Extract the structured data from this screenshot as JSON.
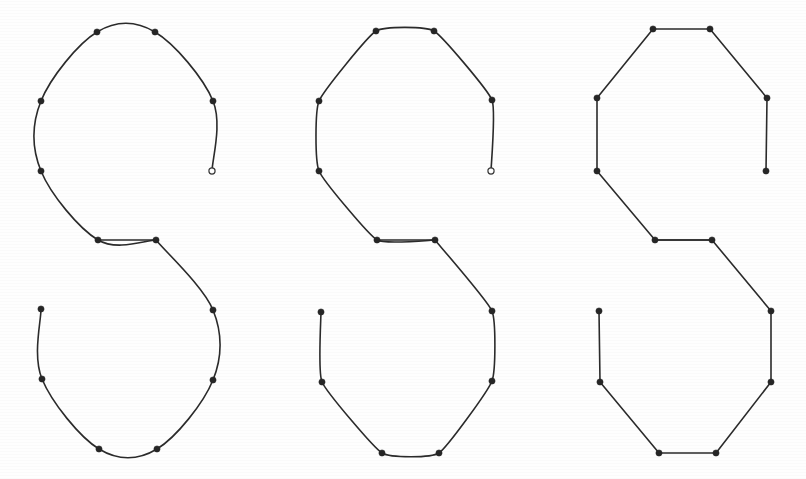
{
  "figure": {
    "caption": "",
    "background_color": "#fefefe",
    "stroke_color": "#2b2b2b",
    "dot_color": "#262626",
    "stroke_width": 1.6,
    "dot_radius": 3.1,
    "width": 806,
    "height": 479
  },
  "chart_data": {
    "type": "line",
    "subtitle": "",
    "xlabel": "",
    "ylabel": "",
    "grid": false,
    "legend": "none",
    "xlim": [
      0,
      806
    ],
    "ylim": [
      479,
      0
    ],
    "note": "Three panels, left to right: smooth limit curve, one subdivision refinement, original control polygon. All three panels share the same 16 marked sample points at identical relative positions.",
    "panels": [
      {
        "name": "limit-curve",
        "label": "smooth limit curve",
        "index": 0,
        "origin_x": 41,
        "rendering": "smooth",
        "closed": true,
        "points": [
          {
            "x": 97,
            "y": 32
          },
          {
            "x": 155,
            "y": 32
          },
          {
            "x": 213,
            "y": 101
          },
          {
            "x": 212,
            "y": 171
          },
          {
            "x": 156,
            "y": 240
          },
          {
            "x": 98,
            "y": 240
          },
          {
            "x": 41,
            "y": 171
          },
          {
            "x": 41,
            "y": 101
          }
        ],
        "points_lower": [
          {
            "x": 213,
            "y": 310
          },
          {
            "x": 213,
            "y": 380
          },
          {
            "x": 157,
            "y": 449
          },
          {
            "x": 99,
            "y": 449
          },
          {
            "x": 42,
            "y": 379
          },
          {
            "x": 41,
            "y": 309
          }
        ],
        "open_endpoints": [
          {
            "x": 212,
            "y": 171,
            "style": "hollow"
          },
          {
            "x": 41,
            "y": 309,
            "style": "filled"
          }
        ]
      },
      {
        "name": "one-refinement",
        "label": "one subdivision step",
        "index": 1,
        "origin_x": 319,
        "rendering": "lightly-rounded",
        "closed": true,
        "points": [
          {
            "x": 376,
            "y": 31
          },
          {
            "x": 434,
            "y": 31
          },
          {
            "x": 492,
            "y": 100
          },
          {
            "x": 491,
            "y": 171
          },
          {
            "x": 435,
            "y": 240
          },
          {
            "x": 377,
            "y": 240
          },
          {
            "x": 319,
            "y": 171
          },
          {
            "x": 319,
            "y": 101
          }
        ],
        "points_lower": [
          {
            "x": 492,
            "y": 311
          },
          {
            "x": 492,
            "y": 381
          },
          {
            "x": 439,
            "y": 453
          },
          {
            "x": 382,
            "y": 453
          },
          {
            "x": 322,
            "y": 382
          },
          {
            "x": 321,
            "y": 312
          }
        ],
        "open_endpoints": [
          {
            "x": 491,
            "y": 171,
            "style": "hollow"
          },
          {
            "x": 321,
            "y": 312,
            "style": "filled"
          }
        ]
      },
      {
        "name": "control-polygon",
        "label": "original control polygon",
        "index": 2,
        "origin_x": 597,
        "rendering": "polyline",
        "closed": true,
        "points": [
          {
            "x": 653,
            "y": 29
          },
          {
            "x": 710,
            "y": 29
          },
          {
            "x": 767,
            "y": 98
          },
          {
            "x": 766,
            "y": 171
          },
          {
            "x": 712,
            "y": 240
          },
          {
            "x": 655,
            "y": 240
          },
          {
            "x": 597,
            "y": 171
          },
          {
            "x": 597,
            "y": 98
          }
        ],
        "points_lower": [
          {
            "x": 771,
            "y": 311
          },
          {
            "x": 771,
            "y": 382
          },
          {
            "x": 716,
            "y": 453
          },
          {
            "x": 659,
            "y": 453
          },
          {
            "x": 600,
            "y": 382
          },
          {
            "x": 599,
            "y": 311
          }
        ],
        "open_endpoints": [
          {
            "x": 766,
            "y": 171,
            "style": "filled"
          },
          {
            "x": 599,
            "y": 311,
            "style": "filled"
          }
        ]
      }
    ]
  }
}
